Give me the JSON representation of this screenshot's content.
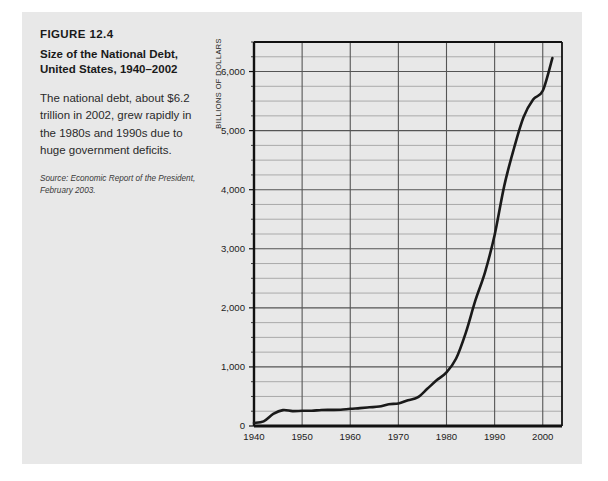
{
  "figure": {
    "number": "FIGURE 12.4",
    "description": "The national debt, about $6.2 trillion in 2002, grew rapidly in the 1980s and 1990s due to huge government deficits.",
    "source": "Source: Economic Report of the President, February 2003."
  },
  "colors": {
    "panel_background": "#e8e8e8",
    "page_background": "#ffffff",
    "line": "#1a1a1a",
    "gridline_major": "#555555",
    "gridline_minor": "#8f8f8f",
    "axis": "#111111",
    "text": "#1a1a1a"
  },
  "chart_data": {
    "type": "line",
    "xlabel": "",
    "ylabel": "BILLIONS OF DOLLARS",
    "xlim": [
      1940,
      2004
    ],
    "ylim": [
      0,
      6500
    ],
    "grid": true,
    "legend": "none",
    "y_major_ticks": [
      0,
      1000,
      2000,
      3000,
      4000,
      5000,
      6000
    ],
    "y_major_tick_labels": [
      "0",
      "1,000",
      "2,000",
      "3,000",
      "4,000",
      "5,000",
      "6,000"
    ],
    "y_minor_tick_interval": 250,
    "x_major_ticks": [
      1940,
      1950,
      1960,
      1970,
      1980,
      1990,
      2000
    ],
    "x_major_tick_labels": [
      "1940",
      "1950",
      "1960",
      "1970",
      "1980",
      "1990",
      "2000"
    ],
    "series": [
      {
        "name": "National debt",
        "x": [
          1940,
          1942,
          1944,
          1946,
          1948,
          1950,
          1952,
          1954,
          1956,
          1958,
          1960,
          1962,
          1964,
          1966,
          1968,
          1970,
          1972,
          1974,
          1976,
          1978,
          1980,
          1982,
          1984,
          1986,
          1988,
          1990,
          1992,
          1994,
          1996,
          1998,
          2000,
          2002
        ],
        "values": [
          51,
          79,
          204,
          269,
          252,
          257,
          259,
          271,
          273,
          276,
          291,
          303,
          317,
          329,
          369,
          381,
          436,
          484,
          629,
          777,
          909,
          1142,
          1577,
          2125,
          2602,
          3233,
          4065,
          4693,
          5225,
          5526,
          5674,
          6228
        ]
      }
    ]
  }
}
